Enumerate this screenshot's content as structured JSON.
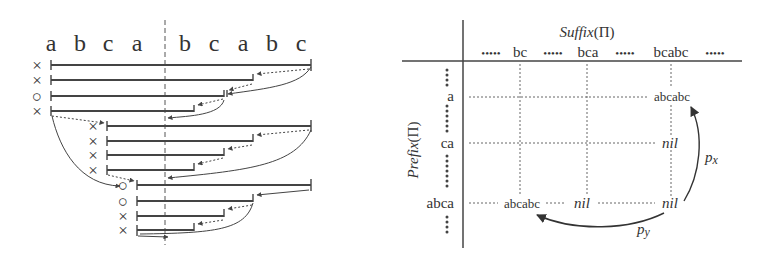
{
  "left_diagram": {
    "string_letters": [
      "a",
      "b",
      "c",
      "a",
      "b",
      "c",
      "a",
      "b",
      "c"
    ],
    "groups": [
      {
        "markers": [
          "×",
          "×",
          "○",
          "×"
        ]
      },
      {
        "markers": [
          "×",
          "×",
          "×",
          "×"
        ]
      },
      {
        "markers": [
          "○",
          "○",
          "×",
          "×"
        ]
      }
    ]
  },
  "right_diagram": {
    "column_header": "Suffix(Π)",
    "row_header": "Prefix(Π)",
    "columns": [
      "bc",
      "bca",
      "bcabc"
    ],
    "rows": [
      "a",
      "ca",
      "abca"
    ],
    "column_leader": "•••••",
    "cells": {
      "a_bcabc": "abcabc",
      "ca_bcabc": "nil",
      "abca_bc": "abcabc",
      "abca_bca": "nil",
      "abca_bcabc": "nil"
    },
    "arrows": {
      "px": "p",
      "px_sub": "x",
      "py": "p",
      "py_sub": "y"
    }
  }
}
